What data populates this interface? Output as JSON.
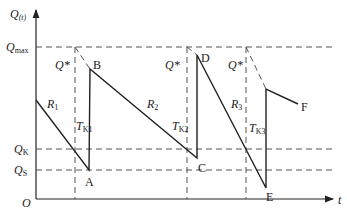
{
  "axes": {
    "y_label": "Q",
    "y_label_sub": "(t)",
    "x_label": "t",
    "origin": "O"
  },
  "levels": {
    "qmax": {
      "label": "Q",
      "sub": "max"
    },
    "qk": {
      "label": "Q",
      "sub": "K"
    },
    "qs": {
      "label": "Q",
      "sub": "S"
    }
  },
  "points": {
    "A": "A",
    "B": "B",
    "C": "C",
    "D": "D",
    "E": "E",
    "F": "F"
  },
  "q_star_labels": [
    "Q*",
    "Q*",
    "Q*"
  ],
  "rates": [
    {
      "label": "R",
      "sub": "1"
    },
    {
      "label": "R",
      "sub": "2"
    },
    {
      "label": "R",
      "sub": "3"
    }
  ],
  "lead_times": [
    {
      "label": "T",
      "sub": "K1"
    },
    {
      "label": "T",
      "sub": "K2"
    },
    {
      "label": "T",
      "sub": "K3"
    }
  ],
  "colors": {
    "line": "#222222",
    "dashed": "#555555",
    "background": "#ffffff"
  }
}
